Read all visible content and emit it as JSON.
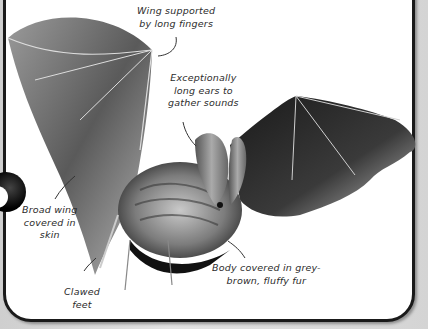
{
  "figure": {
    "labels": [
      {
        "id": "wing-fingers",
        "lines": [
          "Wing supported",
          "by long fingers"
        ]
      },
      {
        "id": "ears",
        "lines": [
          "Exceptionally",
          "long ears to",
          "gather sounds"
        ]
      },
      {
        "id": "broad-wing",
        "lines": [
          "Broad wing",
          "covered in",
          "skin"
        ]
      },
      {
        "id": "feet",
        "lines": [
          "Clawed",
          "feet"
        ]
      },
      {
        "id": "body-fur",
        "lines": [
          "Body covered in grey-",
          "brown, fluffy fur"
        ]
      }
    ]
  },
  "colors": {
    "panel_border": "#1a1a1a",
    "panel_background": "#ffffff",
    "label_text": "#2b2b2b",
    "outer_background": "#d9d9d9"
  }
}
